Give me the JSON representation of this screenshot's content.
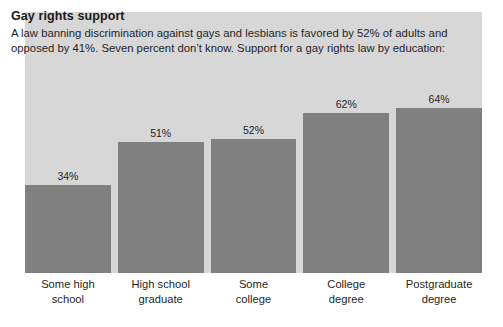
{
  "chart_data": {
    "type": "bar",
    "title": "Gay rights support",
    "subtitle_lines": [
      "A law banning discrimination against gays and lesbians is favored by 52% of adults and",
      "opposed by 41%. Seven percent don’t know. Support for a gay rights law by education:"
    ],
    "categories": [
      "Some high school",
      "High school graduate",
      "Some college",
      "College degree",
      "Postgraduate degree"
    ],
    "category_lines": [
      [
        "Some high",
        "school"
      ],
      [
        "High school",
        "graduate"
      ],
      [
        "Some",
        "college"
      ],
      [
        "College",
        "degree"
      ],
      [
        "Postgraduate",
        "degree"
      ]
    ],
    "values": [
      34,
      51,
      52,
      62,
      64
    ],
    "value_labels": [
      "34%",
      "51%",
      "52%",
      "62%",
      "64%"
    ],
    "unit": "%",
    "xlabel": "",
    "ylabel": "",
    "ylim": [
      0,
      73
    ],
    "grid": false,
    "legend": null,
    "colors": {
      "bar": "#808080",
      "panel_background": "#d7d7d7",
      "figure_background": "#ffffff",
      "text": "#1f1f1f",
      "title_text": "#1a1a1a"
    }
  }
}
